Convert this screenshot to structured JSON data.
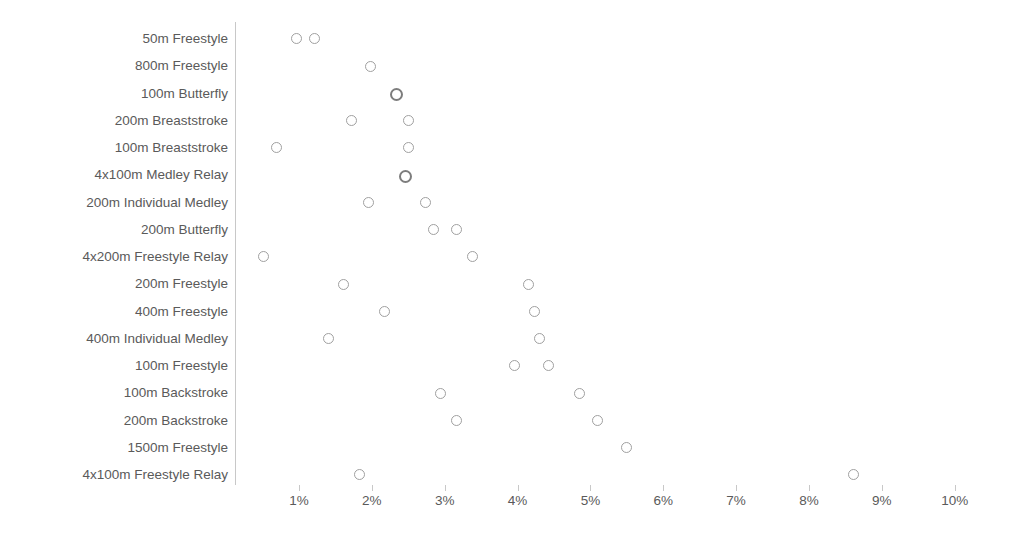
{
  "chart_data": {
    "type": "scatter",
    "title": "",
    "subtitle": "",
    "xlabel": "",
    "ylabel": "",
    "grid": false,
    "legend": "none",
    "orientation": "horizontal",
    "xlim": [
      0.5,
      10.3
    ],
    "x_tick_labels": [
      "1%",
      "2%",
      "3%",
      "4%",
      "5%",
      "6%",
      "7%",
      "8%",
      "9%",
      "10%"
    ],
    "x_tick_values": [
      1,
      2,
      3,
      4,
      5,
      6,
      7,
      8,
      9,
      10
    ],
    "categories": [
      "50m Freestyle",
      "800m Freestyle",
      "100m Butterfly",
      "200m Breaststroke",
      "100m Breaststroke",
      "4x100m Medley Relay",
      "200m Individual Medley",
      "200m Butterfly",
      "4x200m Freestyle Relay",
      "200m Freestyle",
      "400m Freestyle",
      "400m Individual Medley",
      "100m Freestyle",
      "100m Backstroke",
      "200m Backstroke",
      "1500m Freestyle",
      "4x100m Freestyle Relay"
    ],
    "series": [
      {
        "name": "Series 1",
        "values": [
          0.97,
          1.99,
          2.33,
          1.72,
          0.69,
          2.45,
          1.82,
          2.83,
          0.6,
          1.59,
          2.15,
          1.41,
          3.88,
          3.8,
          4.04,
          5.6,
          2.69
        ]
      },
      {
        "name": "Series 2",
        "values": [
          1.21,
          1.99,
          2.33,
          2.51,
          2.51,
          2.45,
          2.6,
          3.15,
          3.39,
          4.13,
          4.23,
          4.3,
          4.42,
          5.71,
          6.07,
          5.6,
          8.74
        ]
      }
    ],
    "points": [
      {
        "category": "50m Freestyle",
        "values": [
          0.97,
          1.21
        ],
        "overlap": [
          false,
          false
        ]
      },
      {
        "category": "800m Freestyle",
        "values": [
          1.99
        ],
        "overlap": [
          false
        ]
      },
      {
        "category": "100m Butterfly",
        "values": [
          2.33
        ],
        "overlap": [
          true
        ]
      },
      {
        "category": "200m Breaststroke",
        "values": [
          1.72,
          2.51
        ],
        "overlap": [
          false,
          false
        ]
      },
      {
        "category": "100m Breaststroke",
        "values": [
          0.69,
          2.51
        ],
        "overlap": [
          false,
          false
        ]
      },
      {
        "category": "4x100m Medley Relay",
        "values": [
          2.45
        ],
        "overlap": [
          true
        ]
      },
      {
        "category": "200m Individual Medley",
        "values": [
          1.96,
          2.74
        ],
        "overlap": [
          false,
          false
        ]
      },
      {
        "category": "200m Butterfly",
        "values": [
          2.85,
          3.17
        ],
        "overlap": [
          false,
          false
        ]
      },
      {
        "category": "4x200m Freestyle Relay",
        "values": [
          0.52,
          3.39
        ],
        "overlap": [
          false,
          false
        ]
      },
      {
        "category": "200m Freestyle",
        "values": [
          1.61,
          4.15
        ],
        "overlap": [
          false,
          false
        ]
      },
      {
        "category": "400m Freestyle",
        "values": [
          2.17,
          4.24
        ],
        "overlap": [
          false,
          false
        ]
      },
      {
        "category": "400m Individual Medley",
        "values": [
          1.41,
          4.31
        ],
        "overlap": [
          false,
          false
        ]
      },
      {
        "category": "100m Freestyle",
        "values": [
          3.96,
          4.43
        ],
        "overlap": [
          false,
          false
        ]
      },
      {
        "category": "100m Backstroke",
        "values": [
          2.94,
          4.85
        ],
        "overlap": [
          false,
          false
        ]
      },
      {
        "category": "200m Backstroke",
        "values": [
          3.17,
          5.1
        ],
        "overlap": [
          false,
          false
        ]
      },
      {
        "category": "1500m Freestyle",
        "values": [
          5.5
        ],
        "overlap": [
          false
        ]
      },
      {
        "category": "4x100m Freestyle Relay",
        "values": [
          1.83,
          8.62
        ],
        "overlap": [
          false,
          false
        ]
      }
    ]
  }
}
